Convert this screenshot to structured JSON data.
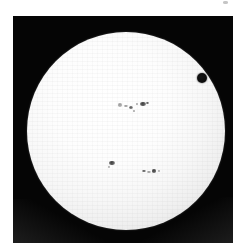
{
  "image": {
    "kind": "astronomical-photograph",
    "subject": "solar-disk-white-light",
    "frame": {
      "background_color": "#ffffff",
      "sky_color": "#050505",
      "left": 13,
      "top": 16,
      "width": 220,
      "height": 227
    },
    "solar_disk": {
      "center_x": 113,
      "center_y": 115,
      "radius": 99,
      "core_color": "#ffffff",
      "limb_color": "#b4b4b4",
      "edge_color": "#8e8e8e"
    },
    "transit_body": {
      "label": "transiting-planet",
      "center_x": 189,
      "center_y": 62,
      "radius": 5,
      "color": "#0a0a0a"
    },
    "scan_artifact": {
      "left": 223,
      "top": 1,
      "width": 5,
      "height": 3
    },
    "sunspots": [
      {
        "id": "spot-upper-a",
        "cx": 107,
        "cy": 89,
        "rx": 2.4,
        "ry": 1.8,
        "class": "faint"
      },
      {
        "id": "spot-upper-b",
        "cx": 113,
        "cy": 90,
        "rx": 1.6,
        "ry": 1.3,
        "class": "faint"
      },
      {
        "id": "spot-upper-c",
        "cx": 118,
        "cy": 91,
        "rx": 2.0,
        "ry": 1.5,
        "class": ""
      },
      {
        "id": "spot-upper-d",
        "cx": 124,
        "cy": 88,
        "rx": 1.4,
        "ry": 1.2,
        "class": "faint"
      },
      {
        "id": "spot-upper-e",
        "cx": 130,
        "cy": 88,
        "rx": 2.6,
        "ry": 2.2,
        "class": "dark"
      },
      {
        "id": "spot-upper-f",
        "cx": 134,
        "cy": 87,
        "rx": 1.5,
        "ry": 1.3,
        "class": ""
      },
      {
        "id": "spot-mid-g",
        "cx": 121,
        "cy": 95,
        "rx": 1.2,
        "ry": 1.0,
        "class": "faint"
      },
      {
        "id": "spot-lower-h",
        "cx": 99,
        "cy": 147,
        "rx": 2.8,
        "ry": 2.4,
        "class": "dark"
      },
      {
        "id": "spot-lower-i",
        "cx": 96,
        "cy": 151,
        "rx": 1.3,
        "ry": 1.0,
        "class": "faint"
      },
      {
        "id": "spot-lower-j",
        "cx": 131,
        "cy": 155,
        "rx": 2.0,
        "ry": 1.2,
        "class": ""
      },
      {
        "id": "spot-lower-k",
        "cx": 136,
        "cy": 156,
        "rx": 1.6,
        "ry": 1.2,
        "class": "faint"
      },
      {
        "id": "spot-lower-l",
        "cx": 141,
        "cy": 155,
        "rx": 2.4,
        "ry": 1.6,
        "class": "dark"
      },
      {
        "id": "spot-lower-m",
        "cx": 146,
        "cy": 155,
        "rx": 1.4,
        "ry": 1.1,
        "class": "faint"
      }
    ]
  }
}
